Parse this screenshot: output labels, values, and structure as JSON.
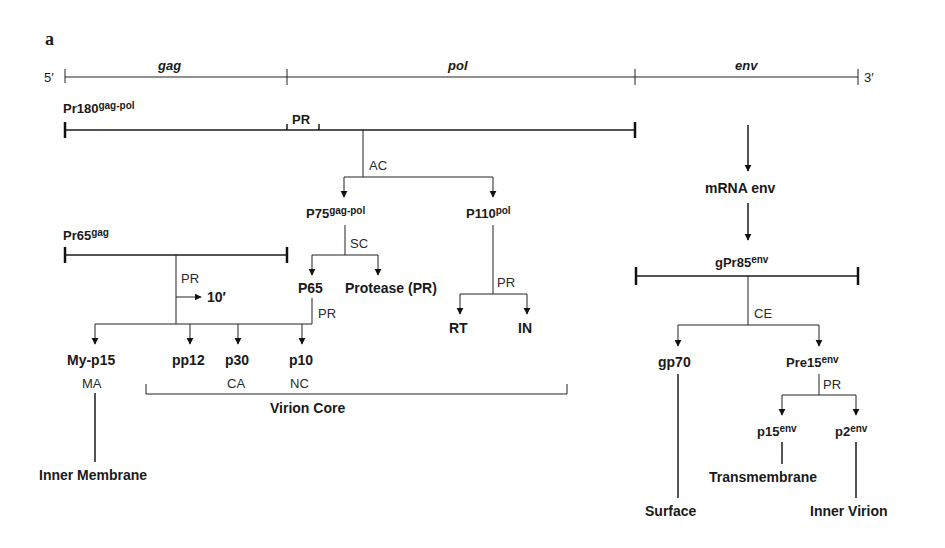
{
  "panel_label": "a",
  "genome": {
    "five_prime": "5′",
    "three_prime": "3′",
    "genes": [
      {
        "name": "gag",
        "label_x": 170
      },
      {
        "name": "pol",
        "label_x": 460
      },
      {
        "name": "env",
        "label_x": 747
      }
    ],
    "boundaries_x": [
      65,
      287,
      635,
      858
    ]
  },
  "precursors": {
    "pr180": {
      "base": "Pr180",
      "sup": "gag-pol",
      "x1": 65,
      "x2": 635,
      "y": 130,
      "pr_region_label": "PR"
    },
    "pr65": {
      "base": "Pr65",
      "sup": "gag",
      "x1": 65,
      "x2": 287,
      "y": 255
    },
    "gpr85": {
      "base": "gPr85",
      "sup": "env",
      "x1": 636,
      "x2": 858,
      "y": 275
    }
  },
  "enzymes": {
    "ac": "AC",
    "sc": "SC",
    "pr": "PR",
    "ce": "CE"
  },
  "products": {
    "p75": {
      "base": "P75",
      "sup": "gag-pol"
    },
    "p110": {
      "base": "P110",
      "sup": "pol"
    },
    "p65": "P65",
    "protease": "Protease (PR)",
    "rt": "RT",
    "in": "IN",
    "my_p15": "My-p15",
    "pp12": "pp12",
    "p30": "p30",
    "p10": "p10",
    "mrna_env": "mRNA env",
    "gp70": "gp70",
    "pre15": {
      "base": "Pre15",
      "sup": "env"
    },
    "p15env": {
      "base": "p15",
      "sup": "env"
    },
    "p2env": {
      "base": "p2",
      "sup": "env"
    },
    "ten_prime": "10′"
  },
  "domains": {
    "ma": "MA",
    "ca": "CA",
    "nc": "NC"
  },
  "locations": {
    "virion_core": "Virion Core",
    "inner_membrane": "Inner Membrane",
    "surface": "Surface",
    "transmembrane": "Transmembrane",
    "inner_virion": "Inner Virion"
  },
  "colors": {
    "ink": "#1a1a1a",
    "background": "#ffffff"
  }
}
